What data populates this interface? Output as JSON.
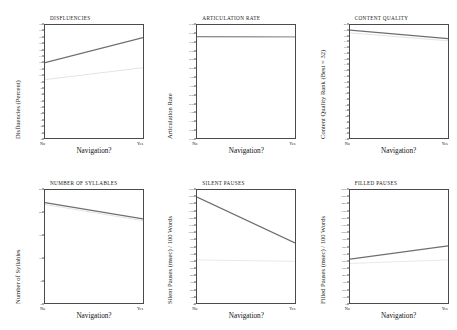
{
  "figure": {
    "xlabel": "Navigation?",
    "x_categories": [
      "No",
      "Yes"
    ],
    "panel_count": 6
  },
  "chart_data": [
    {
      "type": "line",
      "title": "DISFLUENCIES",
      "ylabel": "Disfluencies (Percent)",
      "xlabel": "Navigation?",
      "categories": [
        "No",
        "Yes"
      ],
      "ylim": [
        0,
        18
      ],
      "ytick_step": 1,
      "yticks": [
        0,
        1,
        2,
        3,
        4,
        5,
        6,
        7,
        8,
        9,
        10,
        11,
        12,
        13,
        14,
        15,
        16,
        17,
        18
      ],
      "grid": false,
      "legend": "none",
      "series": [
        {
          "name": "primary",
          "values": [
            12.0,
            16.0
          ],
          "color": "#6e6e6e",
          "width": 1.2
        },
        {
          "name": "secondary",
          "values": [
            9.3,
            11.2
          ],
          "color": "#dcdcdc",
          "width": 0.8
        }
      ]
    },
    {
      "type": "line",
      "title": "ARTICULATION RATE",
      "ylabel": "Articulation Rate",
      "xlabel": "Navigation?",
      "categories": [
        "No",
        "Yes"
      ],
      "ylim": [
        0,
        6.5
      ],
      "ytick_step": 0.5,
      "yticks": [
        "6.50",
        "6.00",
        "5.50",
        "5.00",
        "4.50",
        "4.00",
        "3.50",
        "3.00",
        "2.50",
        "2.00",
        "1.50",
        "1.00",
        "0.50",
        "0.00"
      ],
      "grid": false,
      "legend": "none",
      "series": [
        {
          "name": "primary",
          "values": [
            5.83,
            5.8
          ],
          "color": "#6e6e6e",
          "width": 1.2
        },
        {
          "name": "secondary",
          "values": [
            5.8,
            5.78
          ],
          "color": "#dcdcdc",
          "width": 0.8
        }
      ]
    },
    {
      "type": "line",
      "title": "CONTENT QUALITY",
      "ylabel": "Content Quality Rank (Best = 32)",
      "xlabel": "Navigation?",
      "categories": [
        "No",
        "Yes"
      ],
      "ylim": [
        0,
        20
      ],
      "ytick_step": 1,
      "yticks": [
        0,
        1,
        2,
        3,
        4,
        5,
        6,
        7,
        8,
        9,
        10,
        11,
        12,
        13,
        14,
        15,
        16,
        17,
        18,
        19,
        20
      ],
      "grid": false,
      "legend": "none",
      "series": [
        {
          "name": "primary",
          "values": [
            19.1,
            17.6
          ],
          "color": "#6e6e6e",
          "width": 1.2
        },
        {
          "name": "secondary",
          "values": [
            18.6,
            17.2
          ],
          "color": "#dcdcdc",
          "width": 0.8
        }
      ]
    },
    {
      "type": "line",
      "title": "NUMBER OF SYLLABLES",
      "ylabel": "Number of Syllables",
      "xlabel": "Navigation?",
      "categories": [
        "No",
        "Yes"
      ],
      "ylim": [
        0,
        25
      ],
      "ytick_step": 5,
      "yticks": [
        0,
        5,
        10,
        15,
        20,
        25
      ],
      "grid": false,
      "legend": "none",
      "series": [
        {
          "name": "primary",
          "values": [
            22.2,
            18.6
          ],
          "color": "#6e6e6e",
          "width": 1.2
        },
        {
          "name": "secondary",
          "values": [
            21.8,
            18.2
          ],
          "color": "#dcdcdc",
          "width": 0.8
        }
      ]
    },
    {
      "type": "line",
      "title": "SILENT PAUSES",
      "ylabel": "Silent Pauses (msec) / 100 Words",
      "xlabel": "Navigation?",
      "categories": [
        "No",
        "Yes"
      ],
      "ylim": [
        0,
        1600
      ],
      "ytick_step": 100,
      "yticks": [
        1600,
        1500,
        1400,
        1300,
        1200,
        1100,
        1000,
        900,
        800,
        700,
        600,
        500,
        400,
        300,
        200,
        100,
        0
      ],
      "grid": false,
      "legend": "none",
      "series": [
        {
          "name": "primary",
          "values": [
            1500,
            850
          ],
          "color": "#6e6e6e",
          "width": 1.3
        },
        {
          "name": "secondary",
          "values": [
            610,
            590
          ],
          "color": "#e2e2e2",
          "width": 0.8
        }
      ]
    },
    {
      "type": "line",
      "title": "FILLED PAUSES",
      "ylabel": "Filled Pauses (msec) / 100 Words",
      "xlabel": "Navigation?",
      "categories": [
        "No",
        "Yes"
      ],
      "ylim": [
        0,
        1600
      ],
      "ytick_step": 100,
      "yticks": [
        1600,
        1500,
        1400,
        1300,
        1200,
        1100,
        1000,
        900,
        800,
        700,
        600,
        500,
        400,
        300,
        200,
        100,
        0
      ],
      "grid": false,
      "legend": "none",
      "series": [
        {
          "name": "primary",
          "values": [
            620,
            810
          ],
          "color": "#6e6e6e",
          "width": 1.3
        },
        {
          "name": "secondary",
          "values": [
            560,
            610
          ],
          "color": "#e2e2e2",
          "width": 0.8
        }
      ]
    }
  ]
}
